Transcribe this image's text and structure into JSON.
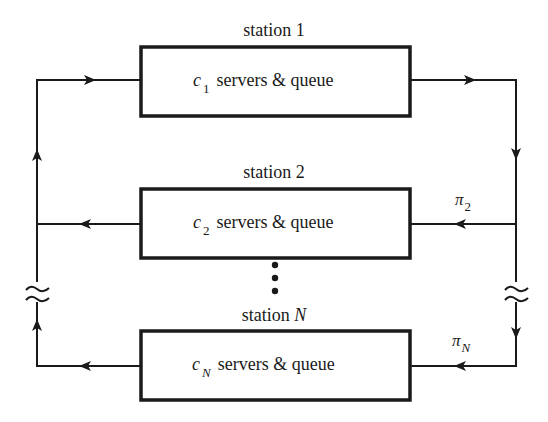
{
  "diagram": {
    "type": "closed queueing network",
    "stations": [
      {
        "title": "station 1",
        "var": "c",
        "sub": "1",
        "text": "servers & queue"
      },
      {
        "title": "station 2",
        "var": "c",
        "sub": "2",
        "text": "servers & queue",
        "routing_var": "π",
        "routing_sub": "2"
      },
      {
        "title_prefix": "station ",
        "title_var": "N",
        "var": "c",
        "sub": "N",
        "text": "servers & queue",
        "routing_var": "π",
        "routing_sub": "N"
      }
    ],
    "colors": {
      "line": "#1a1a1a",
      "background": "#ffffff"
    }
  }
}
